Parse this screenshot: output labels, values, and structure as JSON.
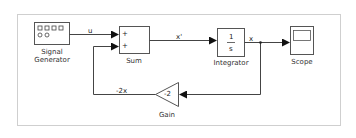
{
  "diagram": {
    "type": "simulink-block-diagram",
    "blocks": [
      {
        "id": "signal_generator",
        "label_line1": "Signal",
        "label_line2": "Generator"
      },
      {
        "id": "sum",
        "label": "Sum",
        "ports": [
          "+",
          "+"
        ]
      },
      {
        "id": "integrator",
        "label": "Integrator",
        "numerator": "1",
        "denominator": "s"
      },
      {
        "id": "scope",
        "label": "Scope"
      },
      {
        "id": "gain",
        "label": "Gain",
        "value": "-2"
      }
    ],
    "signals": [
      {
        "from": "signal_generator",
        "to": "sum",
        "label": "u"
      },
      {
        "from": "sum",
        "to": "integrator",
        "label": "x'"
      },
      {
        "from": "integrator",
        "to": "scope",
        "label": "x"
      },
      {
        "from": "integrator",
        "to": "gain",
        "label": ""
      },
      {
        "from": "gain",
        "to": "sum",
        "label": "-2x"
      }
    ],
    "colors": {
      "line": "#444444",
      "border": "#c8c8c8",
      "block_fill": "#ffffff"
    }
  }
}
